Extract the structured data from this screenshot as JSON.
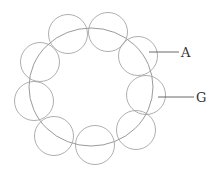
{
  "diagram": {
    "type": "labeled-schematic",
    "colors": {
      "stroke": "#9a9a9a",
      "label": "#333333",
      "background": "#ffffff"
    },
    "large_circle": {
      "label": "G",
      "cx": 91,
      "cy": 87,
      "rx": 62,
      "ry": 59
    },
    "small_circles": [
      {
        "id": 1,
        "cx": 68,
        "cy": 34,
        "r": 19.5
      },
      {
        "id": 2,
        "cx": 108,
        "cy": 32,
        "r": 19.5
      },
      {
        "id": 3,
        "cx": 138,
        "cy": 56,
        "r": 19.5,
        "label": "A"
      },
      {
        "id": 4,
        "cx": 146,
        "cy": 95,
        "r": 19.5
      },
      {
        "id": 5,
        "cx": 136,
        "cy": 130,
        "r": 19.5
      },
      {
        "id": 6,
        "cx": 95,
        "cy": 145,
        "r": 19.5
      },
      {
        "id": 7,
        "cx": 54,
        "cy": 136,
        "r": 19.5
      },
      {
        "id": 8,
        "cx": 34,
        "cy": 101,
        "r": 19.5
      },
      {
        "id": 9,
        "cx": 40,
        "cy": 62,
        "r": 19.5
      }
    ],
    "labels": {
      "a": {
        "text": "A",
        "line_x1": 149,
        "line_x2": 179,
        "y": 52,
        "text_x": 181,
        "text_y": 57
      },
      "g": {
        "text": "G",
        "line_x1": 158,
        "line_x2": 194,
        "y": 97,
        "text_x": 196,
        "text_y": 102
      }
    }
  }
}
